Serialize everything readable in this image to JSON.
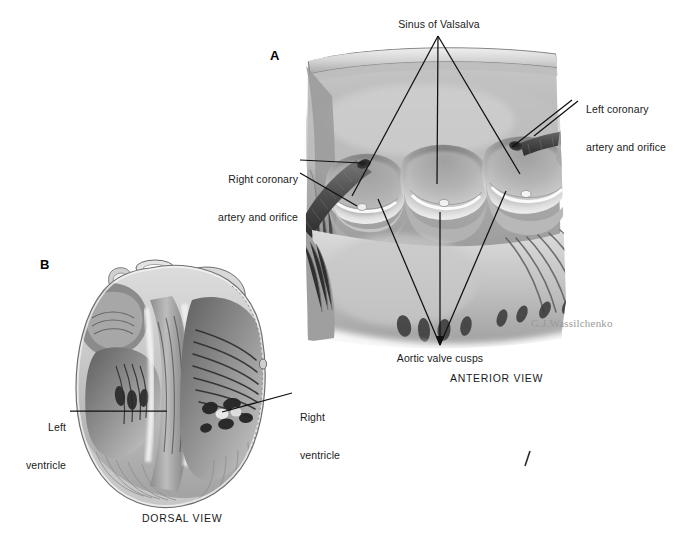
{
  "figure": {
    "artist_signature": "G.J.Wassilchenko",
    "background_color": "#ffffff",
    "ink_color": "#1a1a1a"
  },
  "panels": [
    {
      "letter": "A",
      "view_name": "ANTERIOR VIEW",
      "subject": "Opened aortic root showing three sinuses of Valsalva, aortic valve cusps and coronary ostia"
    },
    {
      "letter": "B",
      "view_name": "DORSAL VIEW",
      "subject": "Coronal section of the heart showing left and right ventricles"
    }
  ],
  "labels": {
    "sinus_of_valsalva": "Sinus of Valsalva",
    "left_coronary": "Left coronary\nartery and orifice",
    "left_coronary_line1": "Left coronary",
    "left_coronary_line2": "artery and orifice",
    "right_coronary_line1": "Right coronary",
    "right_coronary_line2": "artery and orifice",
    "aortic_valve_cusps": "Aortic valve cusps",
    "left_ventricle_line1": "Left",
    "left_ventricle_line2": "ventricle",
    "right_ventricle_line1": "Right",
    "right_ventricle_line2": "ventricle"
  },
  "view_names": {
    "anterior": "ANTERIOR VIEW",
    "dorsal": "DORSAL VIEW"
  },
  "panel_letters": {
    "a": "A",
    "b": "B"
  },
  "anatomy": {
    "sinuses_count": 3,
    "cusps_count": 3,
    "coronary_ostia": [
      "right coronary orifice",
      "left coronary orifice"
    ],
    "ventricles": [
      "left ventricle",
      "right ventricle"
    ]
  }
}
